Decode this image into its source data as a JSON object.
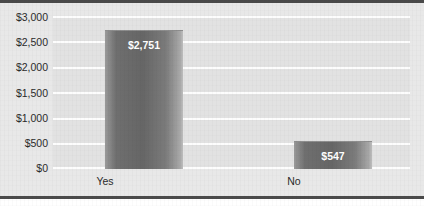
{
  "chart_data": {
    "type": "bar",
    "title": "",
    "subtitle": "",
    "xlabel": "",
    "ylabel": "",
    "categories": [
      "Yes",
      "No"
    ],
    "values": [
      2751,
      547
    ],
    "data_labels": [
      "$2,751",
      "$547"
    ],
    "ylim": [
      0,
      3000
    ],
    "ytick_values": [
      3000,
      2500,
      2000,
      1500,
      1000,
      500,
      0
    ],
    "ytick_labels": [
      "$3,000",
      "$2,500",
      "$2,000",
      "$1,500",
      "$1,000",
      "$500",
      "$0"
    ],
    "grid": true,
    "grid_color": "#fdfdfd",
    "legend": null,
    "legend_position": "none",
    "plot_background": "#e2e2e2",
    "figure_background": "#e8e8e8",
    "bar_color": "#6f6f6f",
    "data_label_color": "#ffffff",
    "axis_text_color": "#2b2b2b",
    "border_color": "#4a4a4a",
    "series": [
      {
        "name": "Amount",
        "values": [
          2751,
          547
        ]
      }
    ]
  }
}
